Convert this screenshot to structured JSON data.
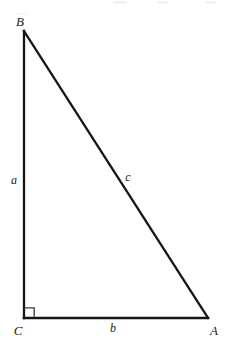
{
  "figure": {
    "kind": "right-triangle-diagram",
    "background_color": "#ffffff",
    "stroke_color": "#151515",
    "label_color": "#1a1a1a",
    "width": 229,
    "height": 350
  },
  "vertices": {
    "B": {
      "label": "B",
      "x": 24,
      "y": 31
    },
    "C": {
      "label": "C",
      "x": 24,
      "y": 318
    },
    "A": {
      "label": "A",
      "x": 208,
      "y": 318
    }
  },
  "sides": {
    "a": {
      "label": "a",
      "from": "B",
      "to": "C"
    },
    "b": {
      "label": "b",
      "from": "C",
      "to": "A"
    },
    "c": {
      "label": "c",
      "from": "B",
      "to": "A"
    }
  },
  "right_angle": {
    "at_vertex": "C",
    "marker": "right-angle-square",
    "size": 9
  }
}
